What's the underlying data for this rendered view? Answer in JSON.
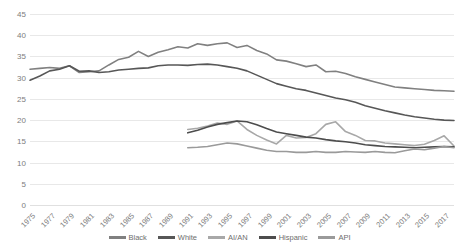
{
  "chart_data": {
    "type": "line",
    "title": "",
    "subtitle": "",
    "xlabel": "",
    "ylabel": "",
    "ylim": [
      0,
      45
    ],
    "ytick_step": 5,
    "yticks": [
      45,
      40,
      35,
      30,
      25,
      20,
      15,
      10,
      5,
      0
    ],
    "grid": true,
    "legend_position": "bottom",
    "x": [
      1975,
      1976,
      1977,
      1978,
      1979,
      1980,
      1981,
      1982,
      1983,
      1984,
      1985,
      1986,
      1987,
      1988,
      1989,
      1990,
      1991,
      1992,
      1993,
      1994,
      1995,
      1996,
      1997,
      1998,
      1999,
      2000,
      2001,
      2002,
      2003,
      2004,
      2005,
      2006,
      2007,
      2008,
      2009,
      2010,
      2011,
      2012,
      2013,
      2014,
      2015,
      2016,
      2017,
      2018
    ],
    "xtick_labels": [
      "1975",
      "1977",
      "1979",
      "1981",
      "1983",
      "1985",
      "1987",
      "1989",
      "1991",
      "1993",
      "1995",
      "1997",
      "1999",
      "2001",
      "2003",
      "2005",
      "2007",
      "2009",
      "2011",
      "2013",
      "2015",
      "2017"
    ],
    "series": [
      {
        "name": "Black",
        "color": "#808080",
        "values": [
          32.0,
          32.2,
          32.4,
          32.2,
          32.8,
          31.2,
          31.4,
          31.6,
          33.0,
          34.3,
          34.8,
          36.2,
          35.0,
          36.0,
          36.6,
          37.3,
          37.0,
          38.0,
          37.6,
          38.0,
          38.2,
          37.1,
          37.6,
          36.4,
          35.6,
          34.2,
          33.9,
          33.3,
          32.6,
          33.0,
          31.4,
          31.5,
          31.0,
          30.2,
          29.6,
          29.0,
          28.4,
          27.8,
          27.6,
          27.4,
          27.2,
          27.0,
          26.9,
          26.8
        ]
      },
      {
        "name": "White",
        "color": "#575757",
        "values": [
          29.4,
          30.4,
          31.6,
          32.0,
          32.8,
          31.5,
          31.6,
          31.2,
          31.4,
          31.8,
          32.0,
          32.2,
          32.3,
          32.8,
          33.0,
          33.0,
          32.9,
          33.1,
          33.2,
          33.0,
          32.6,
          32.2,
          31.6,
          30.6,
          29.6,
          28.6,
          28.0,
          27.4,
          27.0,
          26.4,
          25.8,
          25.2,
          24.8,
          24.2,
          23.4,
          22.8,
          22.2,
          21.7,
          21.2,
          20.8,
          20.5,
          20.2,
          20.0,
          19.9
        ]
      },
      {
        "name": "AI/AN",
        "color": "#a8a8a8",
        "values": [
          null,
          null,
          null,
          null,
          null,
          null,
          null,
          null,
          null,
          null,
          null,
          null,
          null,
          null,
          null,
          null,
          17.8,
          18.1,
          18.6,
          19.3,
          19.0,
          19.8,
          17.8,
          16.4,
          15.3,
          14.4,
          16.4,
          15.8,
          15.9,
          16.8,
          19.0,
          19.6,
          17.3,
          16.4,
          15.2,
          15.1,
          14.6,
          14.4,
          14.2,
          14.0,
          14.3,
          15.2,
          16.3,
          13.9
        ]
      },
      {
        "name": "Hispanic",
        "color": "#4d4d4d",
        "values": [
          null,
          null,
          null,
          null,
          null,
          null,
          null,
          null,
          null,
          null,
          null,
          null,
          null,
          null,
          null,
          null,
          17.0,
          17.6,
          18.4,
          19.0,
          19.4,
          19.8,
          19.6,
          18.9,
          18.0,
          17.2,
          16.8,
          16.4,
          16.0,
          15.8,
          15.4,
          15.1,
          14.9,
          14.6,
          14.2,
          14.0,
          13.8,
          13.7,
          13.6,
          13.5,
          13.6,
          13.7,
          13.8,
          13.7
        ]
      },
      {
        "name": "API",
        "color": "#9a9a9a",
        "values": [
          null,
          null,
          null,
          null,
          null,
          null,
          null,
          null,
          null,
          null,
          null,
          null,
          null,
          null,
          null,
          null,
          13.5,
          13.6,
          13.8,
          14.2,
          14.6,
          14.4,
          13.9,
          13.4,
          12.9,
          12.6,
          12.6,
          12.4,
          12.4,
          12.6,
          12.4,
          12.4,
          12.6,
          12.5,
          12.4,
          12.6,
          12.4,
          12.3,
          12.8,
          13.2,
          13.0,
          13.4,
          13.8,
          13.5
        ]
      }
    ]
  },
  "axis": {
    "y_labels": [
      "45",
      "40",
      "35",
      "30",
      "25",
      "20",
      "15",
      "10",
      "5",
      "0"
    ],
    "x_labels": [
      "1975",
      "1977",
      "1979",
      "1981",
      "1983",
      "1985",
      "1987",
      "1989",
      "1991",
      "1993",
      "1995",
      "1997",
      "1999",
      "2001",
      "2003",
      "2005",
      "2007",
      "2009",
      "2011",
      "2013",
      "2015",
      "2017"
    ]
  },
  "legend": {
    "items": [
      {
        "label": "Black",
        "color": "#808080"
      },
      {
        "label": "White",
        "color": "#575757"
      },
      {
        "label": "AI/AN",
        "color": "#a8a8a8"
      },
      {
        "label": "Hispanic",
        "color": "#4d4d4d"
      },
      {
        "label": "API",
        "color": "#9a9a9a"
      }
    ]
  },
  "colors": {
    "background": "#ffffff",
    "gridline": "#e8e8e8",
    "tick_text": "#7d7d7d"
  }
}
